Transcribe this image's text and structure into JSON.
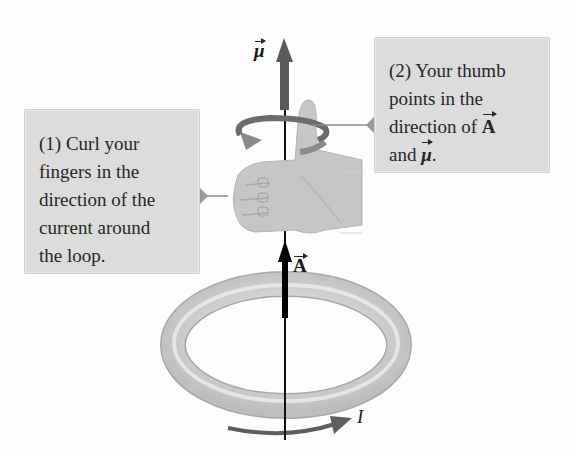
{
  "figure": {
    "callouts": [
      {
        "id": "callout-1",
        "lines": [
          "(1) Curl your",
          "fingers in the",
          "direction of the",
          "current around",
          "the loop."
        ]
      },
      {
        "id": "callout-2",
        "lines": [
          "(2) Your thumb",
          "points in the",
          "direction of ",
          "and ",
          "."
        ],
        "vector_A": "A",
        "vector_mu": "μ"
      }
    ],
    "labels": {
      "mu": "μ",
      "area_vector": "A",
      "current": "I"
    },
    "icons": [
      "hand-thumbs-up-icon",
      "curl-arrow-icon",
      "current-loop-ring-icon",
      "current-arrow-icon",
      "mu-vector-arrow-icon",
      "area-vector-arrow-icon"
    ],
    "colors": {
      "callout_bg": "#dcdcdc",
      "mu_arrow": "#595959",
      "area_arrow": "#000000",
      "ring": "#d0d0d0",
      "hand": "#c9c9c9",
      "text": "#262626"
    }
  }
}
